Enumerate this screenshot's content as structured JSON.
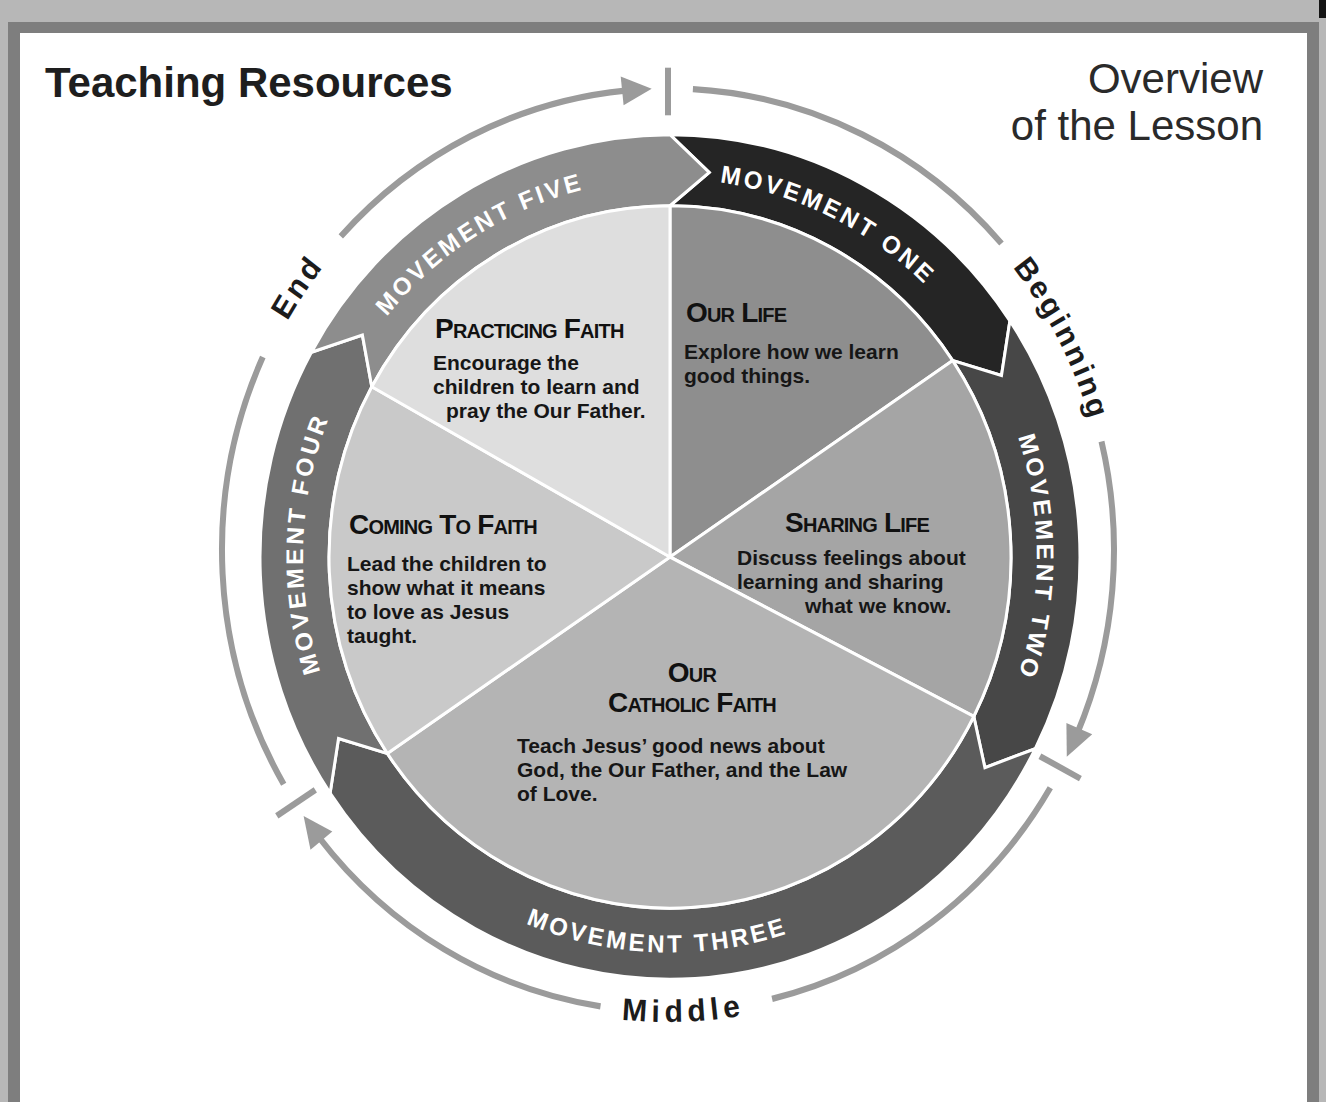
{
  "header": {
    "title": "Teaching Resources",
    "overview_line1": "Overview",
    "overview_line2": "of the Lesson"
  },
  "phases": {
    "beginning": "Beginning",
    "middle": "Middle",
    "end": "End",
    "guide_color": "#9b9b9b"
  },
  "movements": [
    {
      "label": "MOVEMENT ONE",
      "color": "#252525"
    },
    {
      "label": "MOVEMENT TWO",
      "color": "#474747"
    },
    {
      "label": "MOVEMENT THREE",
      "color": "#5b5b5b"
    },
    {
      "label": "MOVEMENT FOUR",
      "color": "#707070"
    },
    {
      "label": "MOVEMENT FIVE",
      "color": "#8d8d8d"
    }
  ],
  "sections": [
    {
      "heading": "Our Life",
      "lines": [
        "Explore how we learn",
        "good things."
      ],
      "color": "#8e8e8e"
    },
    {
      "heading": "Sharing Life",
      "lines": [
        "Discuss feelings about",
        "learning and sharing",
        "what we know."
      ],
      "color": "#a5a5a5"
    },
    {
      "heading_lines": [
        "Our",
        "Catholic Faith"
      ],
      "lines": [
        "Teach Jesus’ good news about",
        "God, the Our Father, and the Law",
        "of Love."
      ],
      "color": "#b4b4b4"
    },
    {
      "heading": "Coming To Faith",
      "lines": [
        "Lead the children to",
        "show what it means",
        "to love as Jesus",
        "taught."
      ],
      "color": "#c9c9c9"
    },
    {
      "heading": "Practicing Faith",
      "lines": [
        "Encourage the",
        "children to learn and",
        "pray the Our Father."
      ],
      "color": "#dedede"
    }
  ]
}
